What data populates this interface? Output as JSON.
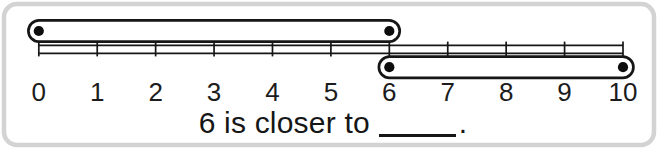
{
  "scene": {
    "background_color": "#ffffff",
    "frame_border_color": "#d3d3d3",
    "ink_color": "#161616"
  },
  "number_line": {
    "min": 0,
    "max": 10,
    "ticks": [
      0,
      1,
      2,
      3,
      4,
      5,
      6,
      7,
      8,
      9,
      10
    ],
    "tick_labels": [
      "0",
      "1",
      "2",
      "3",
      "4",
      "5",
      "6",
      "7",
      "8",
      "9",
      "10"
    ],
    "color": "#161616"
  },
  "bars": [
    {
      "id": "bar-0-to-6",
      "start": 0,
      "end": 6,
      "position": "above-line",
      "endpoint_dots": true
    },
    {
      "id": "bar-6-to-10",
      "start": 6,
      "end": 10,
      "position": "below-line",
      "endpoint_dots": true
    }
  ],
  "caption": {
    "prefix": "6 is closer to",
    "blank_value": "",
    "suffix": "."
  }
}
